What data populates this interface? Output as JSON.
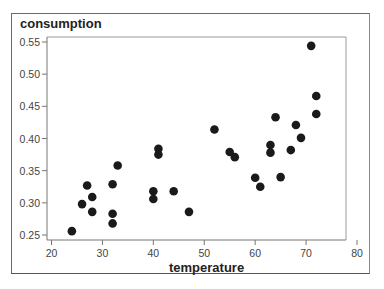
{
  "chart_data": {
    "type": "scatter",
    "title": "",
    "xlabel": "temperature",
    "ylabel": "consumption",
    "xlim": [
      20,
      80
    ],
    "ylim": [
      0.25,
      0.55
    ],
    "x_ticks": [
      20,
      30,
      40,
      50,
      60,
      70,
      80
    ],
    "y_ticks": [
      "0.25",
      "0.30",
      "0.35",
      "0.40",
      "0.45",
      "0.50",
      "0.55"
    ],
    "grid": false,
    "legend": null,
    "marker_color": "#1a1a1a",
    "series": [
      {
        "name": "consumption vs temperature",
        "points": [
          {
            "x": 24,
            "y": 0.256
          },
          {
            "x": 26,
            "y": 0.298
          },
          {
            "x": 27,
            "y": 0.327
          },
          {
            "x": 28,
            "y": 0.309
          },
          {
            "x": 28,
            "y": 0.286
          },
          {
            "x": 32,
            "y": 0.329
          },
          {
            "x": 32,
            "y": 0.283
          },
          {
            "x": 32,
            "y": 0.268
          },
          {
            "x": 33,
            "y": 0.358
          },
          {
            "x": 40,
            "y": 0.318
          },
          {
            "x": 40,
            "y": 0.306
          },
          {
            "x": 41,
            "y": 0.384
          },
          {
            "x": 41,
            "y": 0.375
          },
          {
            "x": 44,
            "y": 0.318
          },
          {
            "x": 47,
            "y": 0.286
          },
          {
            "x": 52,
            "y": 0.414
          },
          {
            "x": 55,
            "y": 0.379
          },
          {
            "x": 56,
            "y": 0.371
          },
          {
            "x": 60,
            "y": 0.339
          },
          {
            "x": 61,
            "y": 0.325
          },
          {
            "x": 63,
            "y": 0.39
          },
          {
            "x": 63,
            "y": 0.378
          },
          {
            "x": 64,
            "y": 0.433
          },
          {
            "x": 65,
            "y": 0.34
          },
          {
            "x": 67,
            "y": 0.382
          },
          {
            "x": 68,
            "y": 0.421
          },
          {
            "x": 69,
            "y": 0.401
          },
          {
            "x": 71,
            "y": 0.544
          },
          {
            "x": 72,
            "y": 0.466
          },
          {
            "x": 72,
            "y": 0.438
          }
        ]
      }
    ]
  }
}
